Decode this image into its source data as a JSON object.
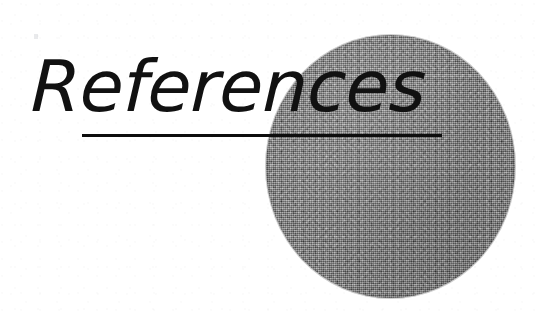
{
  "page": {
    "background_color": "#ffffff",
    "width": 542,
    "height": 315,
    "kind": "scanned-book-section-divider"
  },
  "heading": {
    "text": "References",
    "color": "#111111",
    "style": "oblique light sans-serif",
    "font_size_px": 71
  },
  "rule": {
    "name": "heading-underline",
    "color": "#0d0d0d",
    "x_start": 82,
    "x_end": 442,
    "y": 135,
    "thickness_px": 3
  },
  "ellipse": {
    "name": "grey-halftone-circle",
    "fill_color": "#838383",
    "texture": "dithered-halftone-noise",
    "left": 266,
    "top": 35,
    "width": 249,
    "height": 263
  },
  "artifacts": {
    "speck_label": "scan-speck",
    "speck_color": "#9aa0a8"
  }
}
